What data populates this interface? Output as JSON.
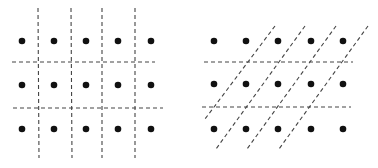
{
  "figure": {
    "background": "#ffffff",
    "dot_color": "#111111",
    "line_color": "#444444",
    "panels": [
      {
        "name": "rectangular-lattice-partition",
        "dots": {
          "xs": [
            22,
            54,
            86,
            118,
            151
          ],
          "ys": [
            41,
            85,
            129
          ],
          "r": 3.3
        },
        "lines": [
          {
            "x1": 38,
            "y1": 8,
            "x2": 39,
            "y2": 158
          },
          {
            "x1": 71,
            "y1": 8,
            "x2": 72,
            "y2": 158
          },
          {
            "x1": 102,
            "y1": 8,
            "x2": 102,
            "y2": 158
          },
          {
            "x1": 135,
            "y1": 8,
            "x2": 135,
            "y2": 158
          },
          {
            "x1": 12,
            "y1": 62,
            "x2": 155,
            "y2": 62
          },
          {
            "x1": 13,
            "y1": 108,
            "x2": 163,
            "y2": 108
          }
        ]
      },
      {
        "name": "oblique-lattice-partition",
        "dots": {
          "xs": [
            214,
            246,
            278,
            311,
            343
          ],
          "ys": [
            41,
            84,
            129
          ],
          "r": 3.3
        },
        "lines": [
          {
            "x1": 204,
            "y1": 62,
            "x2": 353,
            "y2": 62
          },
          {
            "x1": 202,
            "y1": 107,
            "x2": 351,
            "y2": 107
          },
          {
            "x1": 275,
            "y1": 26,
            "x2": 205,
            "y2": 119
          },
          {
            "x1": 305,
            "y1": 26,
            "x2": 216,
            "y2": 149
          },
          {
            "x1": 336,
            "y1": 26,
            "x2": 247,
            "y2": 149
          },
          {
            "x1": 368,
            "y1": 26,
            "x2": 279,
            "y2": 149
          }
        ]
      }
    ]
  }
}
